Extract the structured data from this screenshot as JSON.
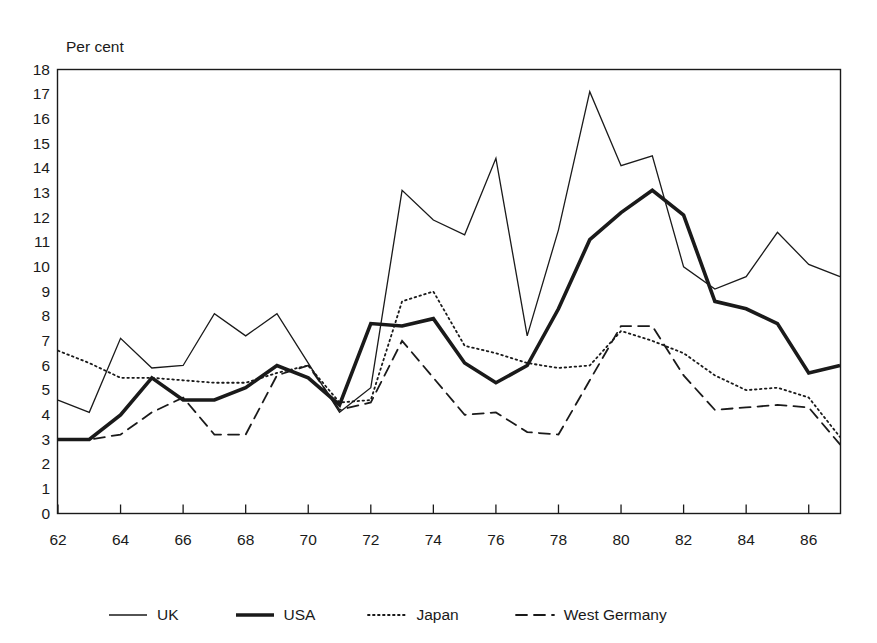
{
  "chart_data": {
    "type": "line",
    "title": "",
    "subtitle": "",
    "xlabel": "",
    "ylabel": "Per cent",
    "ylim": [
      0,
      18
    ],
    "xlim": [
      62,
      87
    ],
    "grid": false,
    "legend_position": "bottom",
    "x": [
      62,
      63,
      64,
      65,
      66,
      67,
      68,
      69,
      70,
      71,
      72,
      73,
      74,
      75,
      76,
      77,
      78,
      79,
      80,
      81,
      82,
      83,
      84,
      85,
      86,
      87
    ],
    "x_tick_labels": [
      "62",
      "64",
      "66",
      "68",
      "70",
      "72",
      "74",
      "76",
      "78",
      "80",
      "82",
      "84",
      "86"
    ],
    "y_tick_labels": [
      "18",
      "17",
      "16",
      "15",
      "14",
      "13",
      "12",
      "11",
      "10",
      "9",
      "8",
      "7",
      "6",
      "5",
      "4",
      "3",
      "2",
      "1",
      "0"
    ],
    "series": [
      {
        "name": "UK",
        "style": "solid-thin",
        "values": [
          4.6,
          4.1,
          7.1,
          5.9,
          6.0,
          8.1,
          7.2,
          8.1,
          6.1,
          4.1,
          5.1,
          13.1,
          11.9,
          11.3,
          14.4,
          7.2,
          11.5,
          17.1,
          14.1,
          14.5,
          10.0,
          9.1,
          9.6,
          11.4,
          10.1,
          9.6
        ]
      },
      {
        "name": "USA",
        "style": "solid-thick",
        "values": [
          3.0,
          3.0,
          4.0,
          5.5,
          4.6,
          4.6,
          5.1,
          6.0,
          5.5,
          4.4,
          7.7,
          7.6,
          7.9,
          6.1,
          5.3,
          6.0,
          8.3,
          11.1,
          12.2,
          13.1,
          12.1,
          8.6,
          8.3,
          7.7,
          5.7,
          6.0
        ]
      },
      {
        "name": "Japan",
        "style": "dotted",
        "values": [
          6.6,
          6.1,
          5.5,
          5.5,
          5.4,
          5.3,
          5.3,
          5.7,
          6.0,
          4.5,
          4.6,
          8.6,
          9.0,
          6.8,
          6.5,
          6.1,
          5.9,
          6.0,
          7.4,
          7.0,
          6.5,
          5.6,
          5.0,
          5.1,
          4.7,
          3.1
        ]
      },
      {
        "name": "West Germany",
        "style": "dashed",
        "values": [
          3.0,
          3.0,
          3.2,
          4.1,
          4.7,
          3.2,
          3.2,
          5.6,
          6.0,
          4.2,
          4.5,
          7.0,
          5.5,
          4.0,
          4.1,
          3.3,
          3.2,
          5.4,
          7.6,
          7.6,
          5.6,
          4.2,
          4.3,
          4.4,
          4.3,
          2.8
        ]
      }
    ],
    "annotations": []
  },
  "legend": {
    "entries": [
      {
        "label": "UK"
      },
      {
        "label": "USA"
      },
      {
        "label": "Japan"
      },
      {
        "label": "West Germany"
      }
    ]
  }
}
